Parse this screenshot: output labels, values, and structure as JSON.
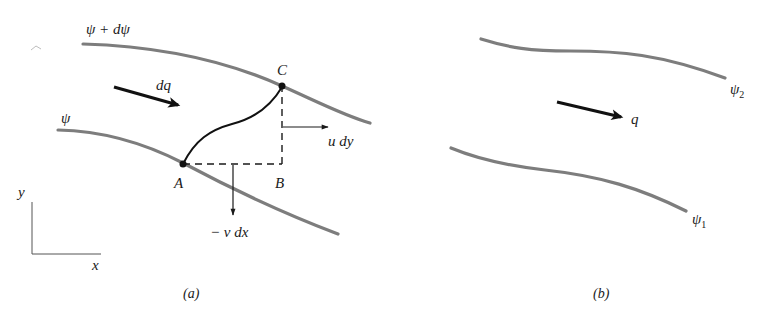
{
  "figure": {
    "panel_a": {
      "caption": "(a)",
      "streamline_upper_label": "ψ + dψ",
      "streamline_lower_label": "ψ",
      "flow_label": "dq",
      "points": {
        "A": "A",
        "B": "B",
        "C": "C"
      },
      "u_flux_label": "u dy",
      "v_flux_label": "− v dx",
      "axes": {
        "x": "x",
        "y": "y"
      }
    },
    "panel_b": {
      "caption": "(b)",
      "streamline_upper_label": "ψ",
      "streamline_upper_sub": "2",
      "streamline_lower_label": "ψ",
      "streamline_lower_sub": "1",
      "flow_label": "q"
    },
    "colors": {
      "streamline": "#7d7d7d",
      "ink": "#1a1a1a",
      "background": "#ffffff"
    }
  }
}
